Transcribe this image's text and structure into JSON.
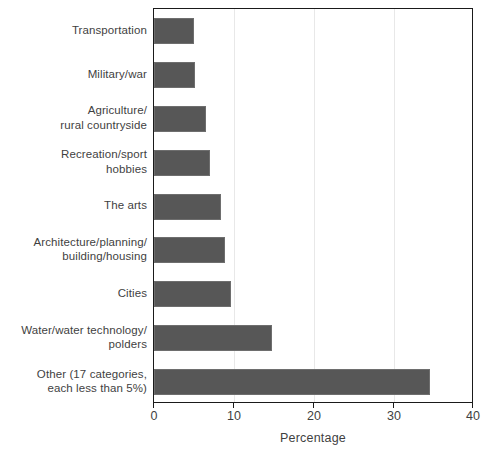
{
  "chart_data": {
    "type": "bar",
    "orientation": "horizontal",
    "title": "",
    "subtitle": "",
    "xlabel": "Percentage",
    "ylabel": "",
    "xlim": [
      0,
      40
    ],
    "xticks": [
      0,
      10,
      20,
      30,
      40
    ],
    "xtick_labels": [
      "0",
      "10",
      "20",
      "30",
      "40"
    ],
    "grid": "vertical",
    "legend": null,
    "bar_color": "#575757",
    "categories": [
      "Transportation",
      "Military/war",
      "Agriculture/\nrural countryside",
      "Recreation/sport\nhobbies",
      "The arts",
      "Architecture/planning/\nbuilding/housing",
      "Cities",
      "Water/water technology/\npolders",
      "Other (17 categories,\neach less than 5%)"
    ],
    "values": [
      5.0,
      5.1,
      6.5,
      7.0,
      8.4,
      8.9,
      9.6,
      14.7,
      34.5
    ]
  },
  "axes": {
    "x_axis_title": "Percentage",
    "x_tick_0": "0",
    "x_tick_1": "10",
    "x_tick_2": "20",
    "x_tick_3": "30",
    "x_tick_4": "40"
  }
}
